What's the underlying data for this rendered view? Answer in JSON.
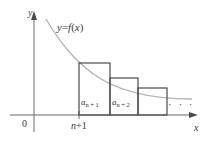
{
  "figure": {
    "background_color": "#ffffff",
    "width": 205,
    "height": 144
  },
  "colors": {
    "axis": "#6b6b6b",
    "curve": "#b4b4b4",
    "rectangle_stroke": "#4a4a4a",
    "text": "#3a3a3a"
  },
  "axes": {
    "y_label": "y",
    "x_label": "x",
    "origin_label": "0",
    "x_axis_y_px": 115,
    "y_axis_x_px": 34,
    "x_arrow_tip_px": 197,
    "y_arrow_tip_px": 12
  },
  "curve": {
    "label": "y = f(x)",
    "label_parts": {
      "y": "y",
      "equals": "=",
      "f": "f",
      "open": "(",
      "x": "x",
      "close": ")"
    },
    "description": "decreasing convex curve",
    "start_px": [
      46,
      19
    ],
    "end_px": [
      192,
      99
    ]
  },
  "ticks": [
    {
      "name": "n-plus-1",
      "label_prefix": "n",
      "label_op": "+",
      "label_value": "1",
      "x_px": 79
    }
  ],
  "rectangles": [
    {
      "name": "a-n-plus-1",
      "label_base": "a",
      "label_sub": "n + 1",
      "x_px": 79,
      "width_px": 31,
      "top_px": 63,
      "height_px": 52
    },
    {
      "name": "a-n-plus-2",
      "label_base": "a",
      "label_sub": "n + 2",
      "x_px": 110,
      "width_px": 28,
      "top_px": 78,
      "height_px": 37
    },
    {
      "name": "a-n-plus-3",
      "label_base": "",
      "label_sub": "",
      "x_px": 138,
      "width_px": 29,
      "top_px": 88,
      "height_px": 27
    }
  ],
  "ellipsis": {
    "text": "· · ·"
  }
}
